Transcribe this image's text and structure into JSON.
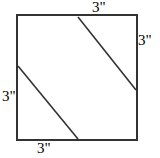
{
  "figure": {
    "kind": "geometry-diagram",
    "canvas": {
      "width": 160,
      "height": 158
    },
    "colors": {
      "background": "#ffffff",
      "stroke": "#333333",
      "diagonal_stroke": "#333333",
      "label_text": "#000000"
    },
    "square": {
      "x": 17,
      "y": 15,
      "width": 120,
      "height": 125,
      "stroke_width": 1.6
    },
    "diagonals": [
      {
        "name": "upper-diagonal",
        "x1": 78,
        "y1": 17,
        "x2": 136,
        "y2": 90,
        "stroke_width": 1.6
      },
      {
        "name": "lower-diagonal",
        "x1": 18,
        "y1": 66,
        "x2": 78,
        "y2": 139,
        "stroke_width": 1.6
      }
    ],
    "labels": {
      "top": "3\"",
      "right": "3\"",
      "left": "3\"",
      "bottom": "3\""
    }
  }
}
